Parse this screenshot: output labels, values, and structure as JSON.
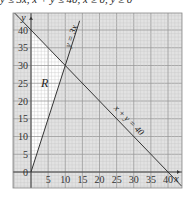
{
  "caption": "y ≤ 3x, x + y ≤ 40, x ≥ 0, y ≥ 0",
  "chart_data": {
    "type": "line",
    "title": "",
    "xlabel": "x",
    "ylabel": "y",
    "xlim": [
      -5,
      43
    ],
    "ylim": [
      -4,
      44
    ],
    "grid": true,
    "x_ticks": [
      "0",
      "5",
      "10",
      "15",
      "20",
      "25",
      "30",
      "35",
      "40"
    ],
    "y_ticks": [
      "0",
      "5",
      "10",
      "15",
      "20",
      "25",
      "30",
      "35",
      "40"
    ],
    "series": [
      {
        "name": "y = 3x",
        "points": [
          [
            0,
            0
          ],
          [
            14.2,
            42.6
          ]
        ]
      },
      {
        "name": "x + y = 40",
        "points": [
          [
            -5,
            45
          ],
          [
            44,
            -4
          ]
        ]
      }
    ],
    "region": {
      "label": "R",
      "vertices": [
        [
          0,
          0
        ],
        [
          10,
          30
        ],
        [
          0,
          40
        ]
      ],
      "fill": "#ffffff"
    },
    "annotations": [
      {
        "text": "y = 3x",
        "at": [
          12.5,
          38
        ],
        "rotation": -72
      },
      {
        "text": "x + y = 40",
        "at": [
          28,
          14
        ],
        "rotation": 45
      },
      {
        "text": "R",
        "at": [
          4,
          24
        ]
      }
    ]
  },
  "colors": {
    "grid_minor": "#c8c8c8",
    "grid_major": "#9a9a9a",
    "shade": "#e2e2e2",
    "line": "#333333"
  }
}
